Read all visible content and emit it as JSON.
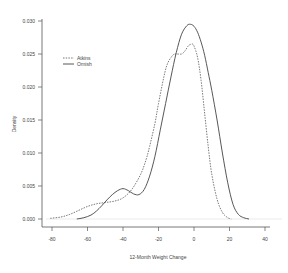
{
  "chart_data": {
    "type": "line",
    "title": "",
    "xlabel": "12-Month Weight Change",
    "ylabel": "Density",
    "xlim": [
      -85,
      45
    ],
    "ylim": [
      0,
      0.03
    ],
    "xticks": [
      -80,
      -60,
      -40,
      -20,
      0,
      20,
      40
    ],
    "xtick_labels": [
      "-80",
      "-60",
      "-40",
      "-20",
      "0",
      "20",
      "40"
    ],
    "yticks": [
      0.0,
      0.005,
      0.01,
      0.015,
      0.02,
      0.025,
      0.03
    ],
    "ytick_labels": [
      "0.000",
      "0.005",
      "0.010",
      "0.015",
      "0.020",
      "0.025",
      "0.030"
    ],
    "grid": false,
    "legend_position": "upper-left",
    "series": [
      {
        "name": "Atkins",
        "style": "dashed",
        "color": "#555555",
        "x": [
          -81,
          -75,
          -70,
          -65,
          -60,
          -55,
          -50,
          -45,
          -40,
          -35,
          -30,
          -27,
          -25,
          -22,
          -20,
          -17,
          -15,
          -12,
          -10,
          -7,
          -5,
          -3,
          -1,
          0,
          2,
          4,
          6,
          8,
          10,
          13,
          16,
          19,
          21
        ],
        "y": [
          0.0001,
          0.0003,
          0.0007,
          0.0013,
          0.0019,
          0.0023,
          0.0025,
          0.0027,
          0.0032,
          0.0045,
          0.0068,
          0.009,
          0.011,
          0.0145,
          0.0175,
          0.0215,
          0.0235,
          0.0248,
          0.025,
          0.025,
          0.0255,
          0.0263,
          0.0265,
          0.0262,
          0.0245,
          0.021,
          0.016,
          0.011,
          0.0068,
          0.003,
          0.001,
          0.0002,
          0.0
        ]
      },
      {
        "name": "Ornish",
        "style": "solid",
        "color": "#444444",
        "x": [
          -66,
          -62,
          -58,
          -55,
          -52,
          -49,
          -46,
          -43,
          -40,
          -37,
          -34,
          -31,
          -28,
          -25,
          -22,
          -19,
          -16,
          -13,
          -10,
          -7,
          -4,
          -2,
          0,
          2,
          4,
          6,
          8,
          10,
          13,
          16,
          19,
          22,
          25,
          28,
          31
        ],
        "y": [
          0.0,
          0.0002,
          0.0006,
          0.0012,
          0.002,
          0.0029,
          0.0037,
          0.0043,
          0.0046,
          0.0043,
          0.0038,
          0.0037,
          0.0045,
          0.0065,
          0.0095,
          0.0135,
          0.0175,
          0.0215,
          0.0252,
          0.028,
          0.0293,
          0.0295,
          0.0292,
          0.0283,
          0.0268,
          0.0248,
          0.0222,
          0.0195,
          0.015,
          0.01,
          0.0055,
          0.0022,
          0.0007,
          0.0002,
          0.0
        ]
      }
    ]
  },
  "legend": {
    "items": [
      {
        "label": "Atkins",
        "style": "dashed"
      },
      {
        "label": "Ornish",
        "style": "solid"
      }
    ]
  },
  "axes": {
    "xlabel": "12-Month Weight Change",
    "ylabel": "Density"
  }
}
